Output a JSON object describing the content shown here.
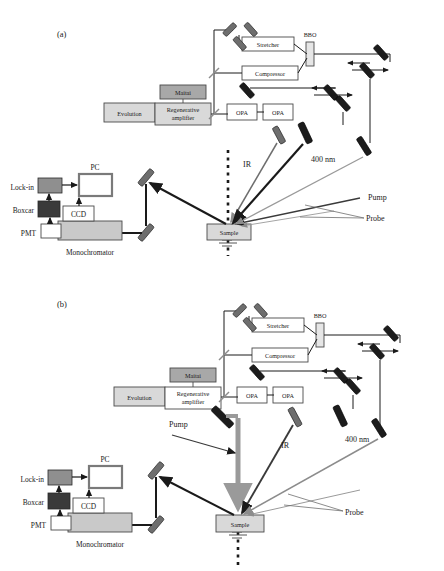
{
  "figure": {
    "type": "optical-setup-diagram",
    "panels": [
      {
        "id": "a",
        "label": "(a)",
        "description": "Femtosecond pump-probe spectroscopy setup with non-collinear pump beam"
      },
      {
        "id": "b",
        "label": "(b)",
        "description": "Femtosecond pump-probe spectroscopy setup with normal-incidence pump beam"
      }
    ]
  },
  "components": {
    "evolution": "Evolution",
    "maitai": "Maitai",
    "regenerative_amplifier_line1": "Regenerative",
    "regenerative_amplifier_line2": "amplifier",
    "stretcher": "Stretcher",
    "compressor": "Compressor",
    "bbo": "BBO",
    "opa1": "OPA",
    "opa2": "OPA",
    "sample": "Sample",
    "monochromator": "Monochromator",
    "pmt": "PMT",
    "ccd": "CCD",
    "boxcar": "Boxcar",
    "lockin": "Lock-in",
    "pc": "PC"
  },
  "beam_labels": {
    "ir": "IR",
    "four_hundred_nm": "400 nm",
    "pump": "Pump",
    "probe": "Probe"
  },
  "colors": {
    "mirror_dark": "#1c1c1c",
    "mirror_gray": "#6e6e6e",
    "box_light_gray": "#d9d9d9",
    "box_mid_gray": "#a8a8a8",
    "box_dark_gray": "#3a3a3a",
    "box_white": "#ffffff",
    "beam_black": "#1a1a1a",
    "beam_gray": "#8c8c8c",
    "outline": "#4a4a4a",
    "background": "#ffffff"
  }
}
